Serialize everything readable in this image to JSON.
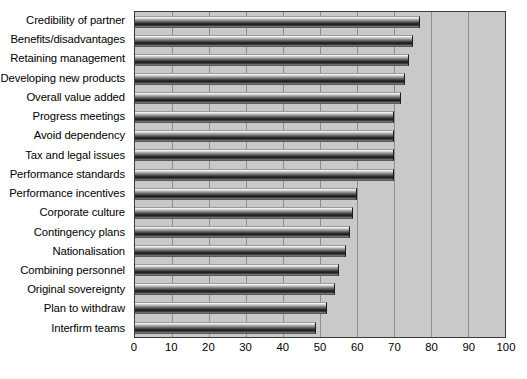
{
  "chart_data": {
    "type": "bar",
    "orientation": "horizontal",
    "title": "",
    "subtitle": "",
    "xlabel": "",
    "ylabel": "",
    "xlim": [
      0,
      100
    ],
    "xticks": [
      0,
      10,
      20,
      30,
      40,
      50,
      60,
      70,
      80,
      90,
      100
    ],
    "grid": true,
    "legend": null,
    "plot_background": "#c9c9c9",
    "bar_color": "#2b2b2b",
    "categories": [
      "Credibility of partner",
      "Benefits/disadvantages",
      "Retaining management",
      "Developing new products",
      "Overall value added",
      "Progress meetings",
      "Avoid dependency",
      "Tax and legal issues",
      "Performance standards",
      "Performance incentives",
      "Corporate culture",
      "Contingency plans",
      "Nationalisation",
      "Combining personnel",
      "Original sovereignty",
      "Plan to withdraw",
      "Interfirm teams"
    ],
    "values": [
      77,
      75,
      74,
      73,
      72,
      70,
      70,
      70,
      70,
      60,
      59,
      58,
      57,
      55,
      54,
      52,
      49
    ]
  }
}
